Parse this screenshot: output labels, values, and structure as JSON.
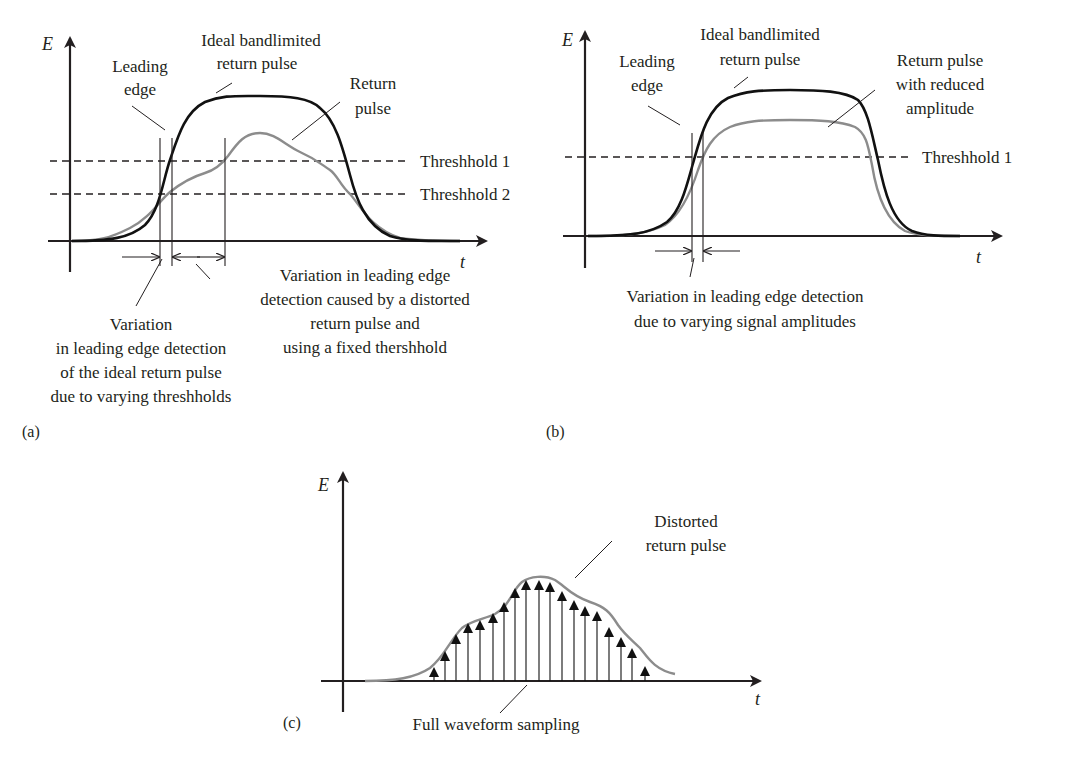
{
  "colors": {
    "ink": "#231f20",
    "ideal_pulse": "#111111",
    "return_pulse": "#8c8c8c"
  },
  "panels": {
    "a": {
      "label": "(a)",
      "axis_y": "E",
      "axis_x": "t",
      "thresholds": [
        "Threshhold 1",
        "Threshhold 2"
      ],
      "leading_edge": [
        "Leading",
        "edge"
      ],
      "ideal_pulse": [
        "Ideal bandlimited",
        "return pulse"
      ],
      "return_pulse": [
        "Return",
        "pulse"
      ],
      "variation_distorted": [
        "Variation in leading edge",
        "detection caused by a distorted",
        "return pulse and",
        "using a fixed thershhold"
      ],
      "variation_thresholds": [
        "Variation",
        "in leading edge detection",
        "of the ideal return pulse",
        "due to varying threshholds"
      ]
    },
    "b": {
      "label": "(b)",
      "axis_y": "E",
      "axis_x": "t",
      "thresholds": [
        "Threshhold 1"
      ],
      "leading_edge": [
        "Leading",
        "edge"
      ],
      "ideal_pulse": [
        "Ideal bandlimited",
        "return pulse"
      ],
      "return_pulse": [
        "Return pulse",
        "with reduced",
        "amplitude"
      ],
      "variation_amplitude": [
        "Variation in leading edge detection",
        "due to varying signal amplitudes"
      ]
    },
    "c": {
      "label": "(c)",
      "axis_y": "E",
      "axis_x": "t",
      "distorted_pulse": [
        "Distorted",
        "return pulse"
      ],
      "sampling": "Full waveform sampling",
      "sample_x": [
        434,
        445,
        456,
        468,
        480,
        493,
        504,
        515,
        526,
        539,
        550,
        562,
        574,
        585,
        597,
        609,
        621,
        632,
        645
      ],
      "sample_tip_y": [
        667,
        651,
        634,
        623,
        620,
        613,
        602,
        588,
        580,
        580,
        582,
        591,
        600,
        606,
        611,
        627,
        637,
        648,
        666
      ]
    }
  }
}
